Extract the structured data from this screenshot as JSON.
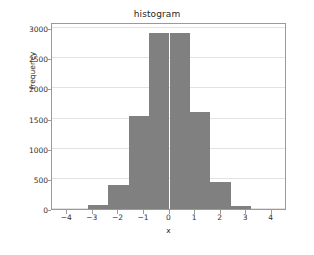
{
  "chart_data": {
    "type": "bar",
    "title": "histogram",
    "xlabel": "x",
    "ylabel": "frequency",
    "grid": "horizontal",
    "legend": null,
    "xlim": [
      -4.6,
      4.6
    ],
    "ylim": [
      0,
      3100
    ],
    "xticks": [
      -4,
      -3,
      -2,
      -1,
      0,
      1,
      2,
      3,
      4
    ],
    "xtick_labels": [
      "−4",
      "−3",
      "−2",
      "−1",
      "0",
      "1",
      "2",
      "3",
      "4"
    ],
    "yticks": [
      0,
      500,
      1000,
      1500,
      2000,
      2500,
      3000
    ],
    "ytick_labels": [
      "0",
      "500",
      "1000",
      "1500",
      "2000",
      "2500",
      "3000"
    ],
    "bar_color": "#808080",
    "bin_edges": [
      -3.2,
      -2.4,
      -1.6,
      -0.8,
      0.0,
      0.8,
      1.6,
      2.4,
      3.2
    ],
    "bin_centers": [
      -2.8,
      -2.0,
      -1.2,
      -0.4,
      0.4,
      1.2,
      2.0,
      2.8
    ],
    "values": [
      60,
      400,
      1540,
      2920,
      2920,
      1600,
      450,
      55
    ],
    "bars": [
      {
        "x0": -3.2,
        "x1": -2.4,
        "value": 60
      },
      {
        "x0": -2.4,
        "x1": -1.6,
        "value": 400
      },
      {
        "x0": -1.6,
        "x1": -0.8,
        "value": 1540
      },
      {
        "x0": -0.8,
        "x1": 0.0,
        "value": 2920
      },
      {
        "x0": 0.0,
        "x1": 0.8,
        "value": 2920
      },
      {
        "x0": 0.8,
        "x1": 1.6,
        "value": 1600
      },
      {
        "x0": 1.6,
        "x1": 2.4,
        "value": 450
      },
      {
        "x0": 2.4,
        "x1": 3.2,
        "value": 55
      }
    ]
  }
}
